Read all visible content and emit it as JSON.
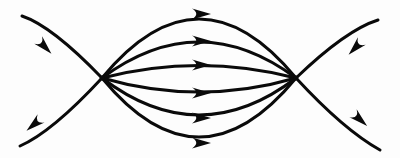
{
  "figure": {
    "background_color": "#fdfdfd",
    "line_color": "#0a0a0a",
    "width": 400,
    "height": 158,
    "node_left": {
      "name": "left-pole",
      "x": 102,
      "y": 78
    },
    "node_right": {
      "name": "right-pole",
      "x": 296,
      "y": 78
    },
    "arc_count": 6,
    "diagonal_count": 4,
    "arrow_count": 10
  },
  "chart_data": {
    "type": "line",
    "xlabel": "",
    "ylabel": "",
    "xlim": [
      0,
      400
    ],
    "ylim": [
      0,
      158
    ],
    "grid": false,
    "legend": "none",
    "nodes": [
      {
        "name": "left-pole",
        "x": 102,
        "y": 78
      },
      {
        "name": "right-pole",
        "x": 296,
        "y": 78
      }
    ],
    "series": [
      {
        "name": "arc-1-top",
        "kind": "arc",
        "direction": "left-to-right",
        "start": [
          102,
          78
        ],
        "end": [
          296,
          78
        ],
        "apex": [
          199,
          14
        ],
        "control": [
          199,
          -40
        ],
        "arrow_at": [
          196,
          14
        ],
        "arrow_angle_deg": 0,
        "stroke_width": 3.1
      },
      {
        "name": "arc-2-upper-mid",
        "kind": "arc",
        "direction": "left-to-right",
        "start": [
          102,
          78
        ],
        "end": [
          296,
          78
        ],
        "apex": [
          199,
          41
        ],
        "control": [
          199,
          6
        ],
        "arrow_at": [
          196,
          41
        ],
        "arrow_angle_deg": 0,
        "stroke_width": 3.1
      },
      {
        "name": "arc-3-upper-inner",
        "kind": "arc",
        "direction": "left-to-right",
        "start": [
          102,
          78
        ],
        "end": [
          296,
          78
        ],
        "apex": [
          199,
          65
        ],
        "control": [
          199,
          53
        ],
        "arrow_at": [
          196,
          65
        ],
        "arrow_angle_deg": 0,
        "stroke_width": 3.0
      },
      {
        "name": "arc-4-lower-inner",
        "kind": "arc",
        "direction": "left-to-right",
        "start": [
          102,
          78
        ],
        "end": [
          296,
          78
        ],
        "apex": [
          199,
          93
        ],
        "control": [
          199,
          106
        ],
        "arrow_at": [
          196,
          93
        ],
        "arrow_angle_deg": 0,
        "stroke_width": 3.0
      },
      {
        "name": "arc-5-lower-mid",
        "kind": "arc",
        "direction": "left-to-right",
        "start": [
          102,
          78
        ],
        "end": [
          296,
          78
        ],
        "apex": [
          199,
          118
        ],
        "control": [
          199,
          152
        ],
        "arrow_at": [
          196,
          118
        ],
        "arrow_angle_deg": 0,
        "stroke_width": 3.1
      },
      {
        "name": "arc-6-bottom",
        "kind": "arc",
        "direction": "left-to-right",
        "start": [
          102,
          78
        ],
        "end": [
          296,
          78
        ],
        "apex": [
          199,
          143
        ],
        "control": [
          199,
          196
        ],
        "arrow_at": [
          196,
          143
        ],
        "arrow_angle_deg": 0,
        "stroke_width": 3.1
      },
      {
        "name": "diagonal-upper-left",
        "kind": "open-curve",
        "direction": "inward-toward-left-pole",
        "start": [
          22,
          16
        ],
        "end": [
          102,
          78
        ],
        "control": [
          52,
          26
        ],
        "arrow_at": [
          41,
          43
        ],
        "arrow_angle_deg": 46,
        "stroke_width": 3.0
      },
      {
        "name": "diagonal-lower-left",
        "kind": "open-curve",
        "direction": "outward-from-left-pole",
        "start": [
          102,
          78
        ],
        "end": [
          20,
          146
        ],
        "control": [
          52,
          132
        ],
        "arrow_at": [
          38,
          121
        ],
        "arrow_angle_deg": 140,
        "stroke_width": 3.0
      },
      {
        "name": "diagonal-upper-right",
        "kind": "open-curve",
        "direction": "inward-toward-right-pole",
        "start": [
          378,
          20
        ],
        "end": [
          296,
          78
        ],
        "control": [
          346,
          30
        ],
        "arrow_at": [
          359,
          44
        ],
        "arrow_angle_deg": 134,
        "stroke_width": 3.0
      },
      {
        "name": "diagonal-lower-right",
        "kind": "open-curve",
        "direction": "outward-from-right-pole",
        "start": [
          296,
          78
        ],
        "end": [
          380,
          150
        ],
        "control": [
          344,
          130
        ],
        "arrow_at": [
          356,
          116
        ],
        "arrow_angle_deg": 42,
        "stroke_width": 3.0
      }
    ]
  }
}
